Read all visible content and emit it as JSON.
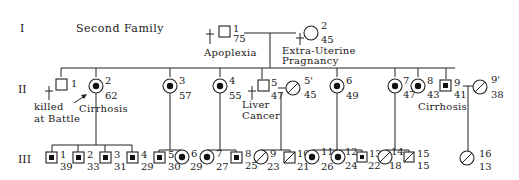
{
  "title": "Second Family",
  "generations": [
    "I",
    "II",
    "III"
  ],
  "gen1": [
    {
      "id": "1",
      "age": "75",
      "sex": "male",
      "status": "deceased",
      "label": "Apoplexia"
    },
    {
      "id": "2",
      "age": "45",
      "sex": "female",
      "status": "deceased",
      "label_line1": "Extra-Uterine",
      "label_line2": "Pragnancy"
    }
  ],
  "gen2": [
    {
      "id": "1",
      "sex": "male",
      "status": "deceased",
      "label_line1": "killed",
      "label_line2": "at Battle"
    },
    {
      "id": "2",
      "age": "62",
      "sex": "female",
      "status": "carrier-proband",
      "label": "Cirrhosis"
    },
    {
      "id": "3",
      "age": "57",
      "sex": "female",
      "status": "carrier"
    },
    {
      "id": "4",
      "age": "55",
      "sex": "female",
      "status": "carrier"
    },
    {
      "id": "5",
      "age": "47",
      "sex": "male",
      "status": "deceased",
      "label_line1": "Liver",
      "label_line2": "Cancer"
    },
    {
      "id": "5'",
      "age": "45",
      "sex": "female",
      "status": "normal-spouse"
    },
    {
      "id": "6",
      "age": "49",
      "sex": "female",
      "status": "carrier"
    },
    {
      "id": "7",
      "age": "47",
      "sex": "female",
      "status": "carrier"
    },
    {
      "id": "8",
      "age": "43",
      "sex": "female",
      "status": "carrier"
    },
    {
      "id": "9",
      "age": "41",
      "sex": "male",
      "status": "affected",
      "label": "Cirrhosis"
    },
    {
      "id": "9'",
      "age": "38",
      "sex": "female",
      "status": "normal-spouse"
    }
  ],
  "gen3": [
    {
      "id": "1",
      "age": "39",
      "sex": "male",
      "status": "affected"
    },
    {
      "id": "2",
      "age": "33",
      "sex": "male",
      "status": "affected"
    },
    {
      "id": "3",
      "age": "31",
      "sex": "male",
      "status": "affected"
    },
    {
      "id": "4",
      "age": "29",
      "sex": "male",
      "status": "affected"
    },
    {
      "id": "5",
      "age": "30",
      "sex": "male",
      "status": "affected"
    },
    {
      "id": "6",
      "age": "29",
      "sex": "female",
      "status": "carrier"
    },
    {
      "id": "7",
      "age": "27",
      "sex": "female",
      "status": "carrier"
    },
    {
      "id": "8",
      "age": "25",
      "sex": "male",
      "status": "affected"
    },
    {
      "id": "9",
      "age": "23",
      "sex": "female",
      "status": "normal"
    },
    {
      "id": "10",
      "age": "21",
      "sex": "male",
      "status": "normal"
    },
    {
      "id": "11",
      "age": "26",
      "sex": "female",
      "status": "carrier"
    },
    {
      "id": "12",
      "age": "24",
      "sex": "female",
      "status": "carrier"
    },
    {
      "id": "13",
      "age": "22",
      "sex": "male",
      "status": "affected"
    },
    {
      "id": "14",
      "age": "18",
      "sex": "female",
      "status": "normal"
    },
    {
      "id": "15",
      "age": "15",
      "sex": "male",
      "status": "normal"
    },
    {
      "id": "16",
      "age": "13",
      "sex": "female",
      "status": "normal"
    }
  ]
}
